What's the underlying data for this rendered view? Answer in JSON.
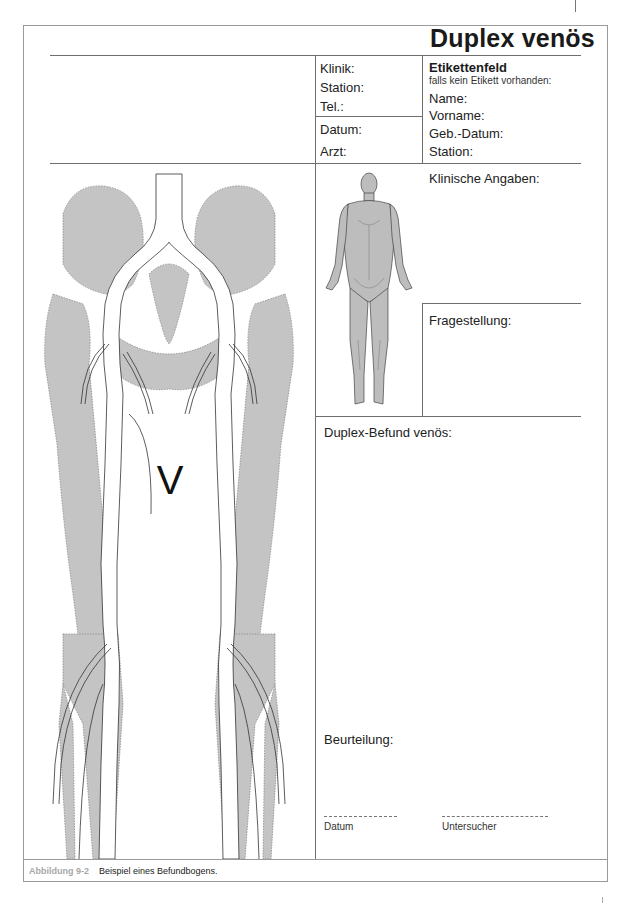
{
  "form": {
    "title": "Duplex venös",
    "clinic_block": {
      "klinik": "Klinik:",
      "station": "Station:",
      "tel": "Tel.:",
      "datum": "Datum:",
      "arzt": "Arzt:"
    },
    "label_block": {
      "heading": "Etikettenfeld",
      "subheading": "falls kein Etikett vorhanden:",
      "name": "Name:",
      "vorname": "Vorname:",
      "geb_datum": "Geb.-Datum:",
      "station": "Station:"
    },
    "sections": {
      "klinische_angaben": "Klinische Angaben:",
      "fragestellung": "Fragestellung:",
      "duplex_befund": "Duplex-Befund venös:",
      "beurteilung": "Beurteilung:"
    },
    "signature": {
      "datum": "Datum",
      "untersucher": "Untersucher"
    },
    "diagram": {
      "label_v": "V",
      "description": "Anatomical diagram of pelvis and legs with venous system",
      "bone_color": "#c4c4c4",
      "vein_color": "#ffffff"
    },
    "body_figure": {
      "description": "Anterior human body outline",
      "fill_color": "#bdbdbd"
    }
  },
  "caption": {
    "figure_label": "Abbildung 9-2",
    "text": "Beispiel eines Befundbogens."
  },
  "colors": {
    "frame": "#9a9a9a",
    "lines": "#6e6e6e",
    "text": "#1a1a1a",
    "caption_label": "#a8a8a8"
  }
}
